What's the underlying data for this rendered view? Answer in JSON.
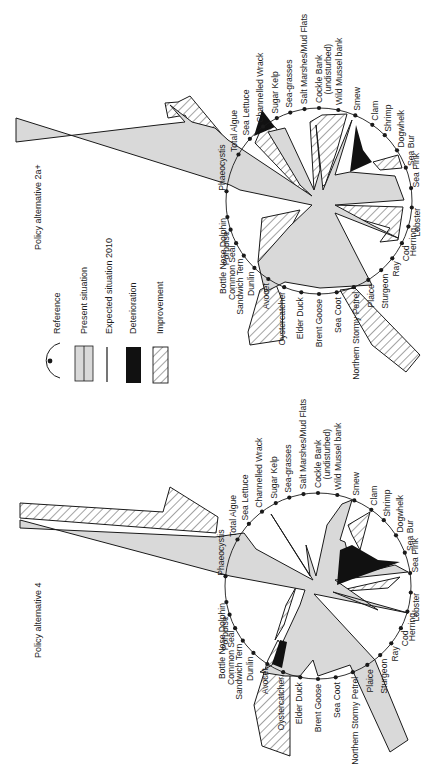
{
  "colors": {
    "present": "#d9d9d9",
    "deterioration": "#111111",
    "improvement_hatch": "#333333",
    "line": "#1a1a1a",
    "background": "#ffffff"
  },
  "legend": {
    "items": [
      {
        "key": "reference",
        "label": "Reference"
      },
      {
        "key": "present",
        "label": "Present situation"
      },
      {
        "key": "expected",
        "label": "Expected situation 2010"
      },
      {
        "key": "deterioration",
        "label": "Deterioration"
      },
      {
        "key": "improvement",
        "label": "Improvement"
      }
    ]
  },
  "charts": [
    {
      "title": "Policy alternative 2a+",
      "center": [
        319,
        201
      ],
      "radius": 93,
      "labels": [
        {
          "text": "Phaeocystis",
          "angle": 174
        },
        {
          "text": "Total Algue",
          "angle": 150
        },
        {
          "text": "Sea Lettuce",
          "angle": 138
        },
        {
          "text": "Channelled Wrack",
          "angle": 127
        },
        {
          "text": "Sugar Kelp",
          "angle": 117
        },
        {
          "text": "Sea-grasses",
          "angle": 108
        },
        {
          "text": "Salt Marshes/Mud Flats",
          "angle": 99
        },
        {
          "text": "Cockle Bank",
          "angle": 90
        },
        {
          "text": "(undisturbed)",
          "angle": 85
        },
        {
          "text": "Wild Mussel bank",
          "angle": 78
        },
        {
          "text": "Smew",
          "angle": 67
        },
        {
          "text": "Clam",
          "angle": 55
        },
        {
          "text": "Shrimp",
          "angle": 45
        },
        {
          "text": "Dogwhelk",
          "angle": 33
        },
        {
          "text": "Sea Bur",
          "angle": 21
        },
        {
          "text": "Sea Pink",
          "angle": 8
        },
        {
          "text": "Lobster",
          "angle": -4
        },
        {
          "text": "Herring",
          "angle": -16
        },
        {
          "text": "Cod",
          "angle": -27
        },
        {
          "text": "Ray",
          "angle": -38
        },
        {
          "text": "Sturgeon",
          "angle": -48
        },
        {
          "text": "Plaice",
          "angle": -58
        },
        {
          "text": "Northern Stormy Petrel",
          "angle": -68
        },
        {
          "text": "Sea Coot",
          "angle": -79
        },
        {
          "text": "Brent Goose",
          "angle": -90
        },
        {
          "text": "Elder Duck",
          "angle": -101
        },
        {
          "text": "Oystercatcher",
          "angle": -112
        },
        {
          "text": "Avocet",
          "angle": -123
        },
        {
          "text": "Dunlin",
          "angle": -134
        },
        {
          "text": "Sandwich Tern",
          "angle": -144
        },
        {
          "text": "Common Seal",
          "angle": -153
        },
        {
          "text": "Porpoise",
          "angle": -162
        },
        {
          "text": "Bottle Nose Dolphin",
          "angle": -170
        }
      ]
    },
    {
      "title": "Policy alternative 4",
      "center": [
        318,
        586
      ],
      "radius": 93,
      "labels": [
        {
          "text": "Phaeocystis",
          "angle": 174
        },
        {
          "text": "Total Algue",
          "angle": 150
        },
        {
          "text": "Sea Lettuce",
          "angle": 138
        },
        {
          "text": "Channelled Wrack",
          "angle": 127
        },
        {
          "text": "Sugar Kelp",
          "angle": 117
        },
        {
          "text": "Sea-grasses",
          "angle": 108
        },
        {
          "text": "Salt Marshes/Mud Flats",
          "angle": 99
        },
        {
          "text": "Cockle Bank",
          "angle": 90
        },
        {
          "text": "(undisturbed)",
          "angle": 85
        },
        {
          "text": "Wild Mussel bank",
          "angle": 78
        },
        {
          "text": "Smew",
          "angle": 67
        },
        {
          "text": "Clam",
          "angle": 55
        },
        {
          "text": "Shrimp",
          "angle": 45
        },
        {
          "text": "Dogwhelk",
          "angle": 33
        },
        {
          "text": "Sea Bur",
          "angle": 21
        },
        {
          "text": "Sea Pink",
          "angle": 8
        },
        {
          "text": "Lobster",
          "angle": -4
        },
        {
          "text": "Herring",
          "angle": -16
        },
        {
          "text": "Cod",
          "angle": -27
        },
        {
          "text": "Ray",
          "angle": -38
        },
        {
          "text": "Sturgeon",
          "angle": -48
        },
        {
          "text": "Plaice",
          "angle": -58
        },
        {
          "text": "Northern Stormy Petrel",
          "angle": -68
        },
        {
          "text": "Sea Coot",
          "angle": -79
        },
        {
          "text": "Brent Goose",
          "angle": -90
        },
        {
          "text": "Elder Duck",
          "angle": -101
        },
        {
          "text": "Oystercatcher",
          "angle": -112
        },
        {
          "text": "Avocet",
          "angle": -123
        },
        {
          "text": "Dunlin",
          "angle": -134
        },
        {
          "text": "Sandwich Tern",
          "angle": -144
        },
        {
          "text": "Common Seal",
          "angle": -153
        },
        {
          "text": "Porpoise",
          "angle": -162
        },
        {
          "text": "Bottle Nose Dolphin",
          "angle": -170
        }
      ]
    }
  ]
}
